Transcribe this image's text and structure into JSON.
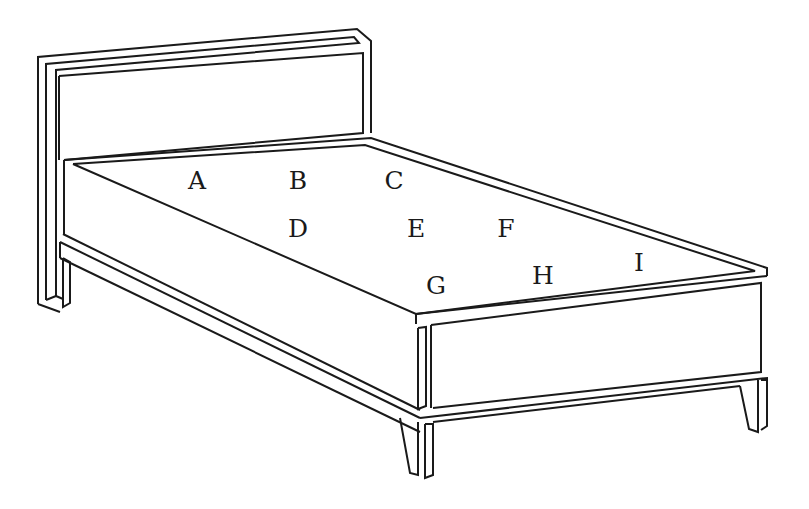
{
  "figure": {
    "positions": [
      {
        "label": "A",
        "x": 197,
        "y": 180
      },
      {
        "label": "B",
        "x": 298,
        "y": 180
      },
      {
        "label": "C",
        "x": 394,
        "y": 180
      },
      {
        "label": "D",
        "x": 298,
        "y": 228
      },
      {
        "label": "E",
        "x": 416,
        "y": 228
      },
      {
        "label": "F",
        "x": 506,
        "y": 228
      },
      {
        "label": "G",
        "x": 436,
        "y": 285
      },
      {
        "label": "H",
        "x": 543,
        "y": 275
      },
      {
        "label": "I",
        "x": 639,
        "y": 262
      }
    ]
  }
}
